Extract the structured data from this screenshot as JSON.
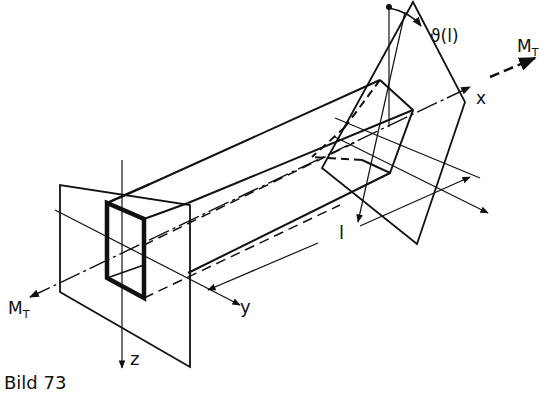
{
  "caption": "Bild 73",
  "labels": {
    "torque_left": "M",
    "torque_left_sub": "T",
    "torque_right": "M",
    "torque_right_sub": "T",
    "axis_x": "x",
    "axis_y": "y",
    "axis_z": "z",
    "length": "l",
    "twist_angle": "ϑ(l)"
  },
  "colors": {
    "line": "#111111",
    "background": "#ffffff"
  }
}
